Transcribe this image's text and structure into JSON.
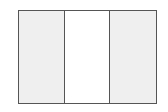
{
  "figure": {
    "kind": "vertical-triband-flag-outline",
    "stripes": [
      {
        "position": "left",
        "color": "#efefef"
      },
      {
        "position": "center",
        "color": "#ffffff"
      },
      {
        "position": "right",
        "color": "#efefef"
      }
    ],
    "border_color": "#555555"
  }
}
